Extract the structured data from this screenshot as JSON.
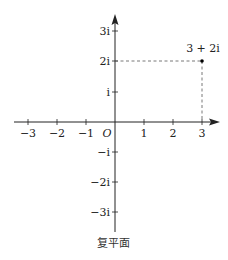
{
  "diagram": {
    "type": "complex-plane",
    "caption": "复平面",
    "origin_label": "O",
    "x_ticks": [
      {
        "value": -3,
        "label": "−3"
      },
      {
        "value": -2,
        "label": "−2"
      },
      {
        "value": -1,
        "label": "−1"
      },
      {
        "value": 1,
        "label": "1"
      },
      {
        "value": 2,
        "label": "2"
      },
      {
        "value": 3,
        "label": "3"
      }
    ],
    "y_ticks": [
      {
        "value": 3,
        "label": "3i"
      },
      {
        "value": 2,
        "label": "2i"
      },
      {
        "value": 1,
        "label": "i"
      },
      {
        "value": -1,
        "label": "−i"
      },
      {
        "value": -2,
        "label": "−2i"
      },
      {
        "value": -3,
        "label": "−3i"
      }
    ],
    "point": {
      "re": 3,
      "im": 2,
      "label": "3 + 2i"
    },
    "colors": {
      "axis": "#222222",
      "dash": "#555555",
      "point": "#000000"
    }
  }
}
